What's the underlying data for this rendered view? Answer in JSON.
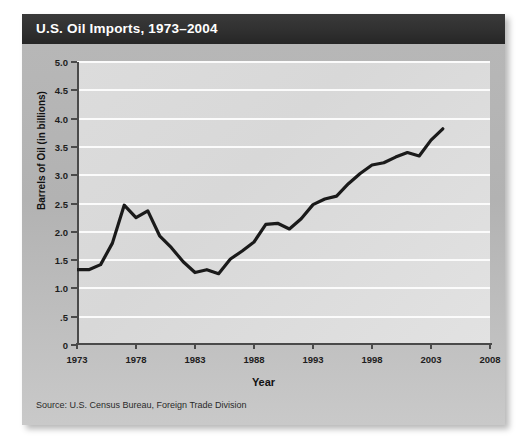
{
  "title": "U.S. Oil Imports, 1973–2004",
  "source": "Source:  U.S. Census Bureau, Foreign Trade Division",
  "colors": {
    "title_bar": "#303030",
    "panel": "#b4b4b4",
    "plot_bg": "#dcdcdc",
    "gridline": "#fbfbfb",
    "axis": "#4a4a4a",
    "line": "#1a1a1a"
  },
  "chart_data": {
    "type": "line",
    "title": "U.S. Oil Imports, 1973–2004",
    "xlabel": "Year",
    "ylabel": "Barrels of Oil (in billions)",
    "xlim": [
      1973,
      2008
    ],
    "ylim": [
      0,
      5.0
    ],
    "grid": true,
    "legend": "none",
    "xticks": [
      1973,
      1978,
      1983,
      1988,
      1993,
      1998,
      2003,
      2008
    ],
    "xticklabels": [
      "1973",
      "1978",
      "1983",
      "1988",
      "1993",
      "1998",
      "2003",
      "2008"
    ],
    "yticks": [
      0,
      0.5,
      1.0,
      1.5,
      2.0,
      2.5,
      3.0,
      3.5,
      4.0,
      4.5,
      5.0
    ],
    "yticklabels": [
      "0",
      ".5",
      "1.0",
      "1.5",
      "2.0",
      "2.5",
      "3.0",
      "3.5",
      "4.0",
      "4.5",
      "5.0"
    ],
    "x": [
      1973,
      1974,
      1975,
      1976,
      1977,
      1978,
      1979,
      1980,
      1981,
      1982,
      1983,
      1984,
      1985,
      1986,
      1987,
      1988,
      1989,
      1990,
      1991,
      1992,
      1993,
      1994,
      1995,
      1996,
      1997,
      1998,
      1999,
      2000,
      2001,
      2002,
      2003,
      2004
    ],
    "series": [
      {
        "name": "U.S. Oil Imports",
        "values": [
          1.33,
          1.33,
          1.42,
          1.8,
          2.47,
          2.25,
          2.37,
          1.93,
          1.72,
          1.47,
          1.28,
          1.33,
          1.26,
          1.52,
          1.66,
          1.82,
          2.13,
          2.15,
          2.05,
          2.23,
          2.48,
          2.58,
          2.63,
          2.85,
          3.03,
          3.18,
          3.22,
          3.32,
          3.4,
          3.34,
          3.62,
          3.82
        ]
      }
    ]
  }
}
